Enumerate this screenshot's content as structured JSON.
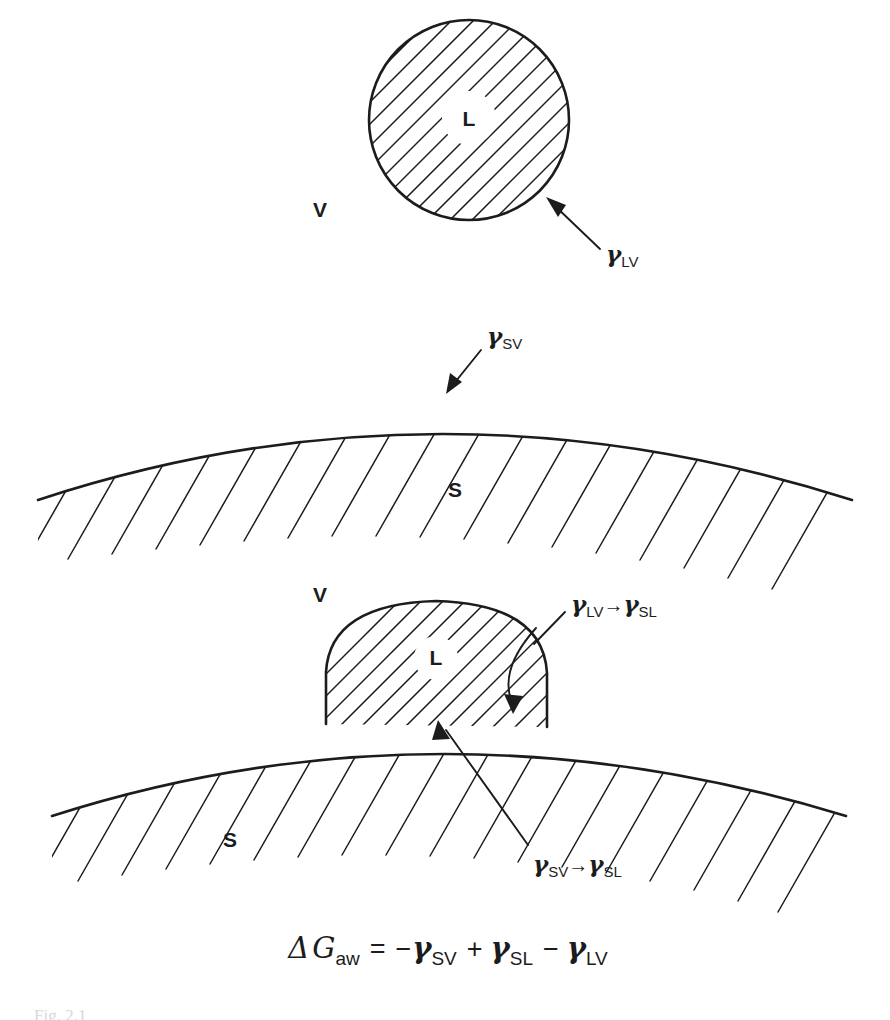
{
  "figure": {
    "domain": "scientific-diagram",
    "background_color": "#ffffff",
    "ink_color": "#1c1c1c"
  },
  "panels": {
    "top": {
      "name": "free-liquid-drop",
      "liquid_label": "L",
      "vapor_label": "V",
      "annotation": {
        "gamma": "γ",
        "sub": "LV"
      }
    },
    "middle": {
      "name": "bare-solid-surface",
      "solid_label": "S",
      "annotation": {
        "gamma": "γ",
        "sub": "SV"
      }
    },
    "bottom": {
      "name": "drop-on-solid",
      "liquid_label": "L",
      "vapor_label": "V",
      "solid_label": "S",
      "annotation_right": {
        "from_gamma": "γ",
        "from_sub": "LV",
        "arrow": "→",
        "to_gamma": "γ",
        "to_sub": "SL"
      },
      "annotation_bottom": {
        "from_gamma": "γ",
        "from_sub": "SV",
        "arrow": "→",
        "to_gamma": "γ",
        "to_sub": "SL"
      }
    }
  },
  "equation": {
    "name": "work-of-adhesion-equation",
    "delta": "Δ",
    "g": "G",
    "g_sub": "aw",
    "equals": "=",
    "term1_sign": "−",
    "term1_gamma": "γ",
    "term1_sub": "SV",
    "term2_sign": "+",
    "term2_gamma": "γ",
    "term2_sub": "SL",
    "term3_sign": "−",
    "term3_gamma": "γ",
    "term3_sub": "LV",
    "plain_text": "ΔG_aw = −γ_SV + γ_SL − γ_LV"
  },
  "caption": {
    "name": "figure-caption-cropped",
    "text": "Fig. 2.1"
  }
}
